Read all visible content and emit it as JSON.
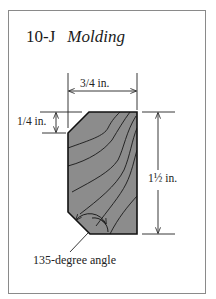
{
  "figure": {
    "id": "10-J",
    "title": "Molding"
  },
  "dimensions": {
    "width_label": "3/4 in.",
    "chamfer_label": "1/4 in.",
    "height_label": "1½ in.",
    "angle_label": "135-degree angle"
  },
  "colors": {
    "wood_fill": "#8c8c8c",
    "outline": "#111111",
    "frame": "#8a8a8a"
  }
}
